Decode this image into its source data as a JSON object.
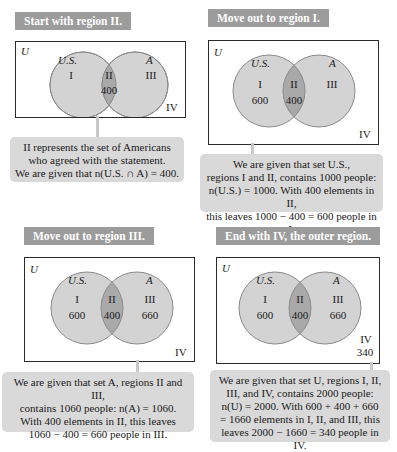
{
  "colors": {
    "title_bg": "#9c9c9c",
    "title_text": "#ffffff",
    "circle_fill": "#d3d3d3",
    "intersection_fill": "#a9a9a9",
    "circle_stroke": "#8a8a8a",
    "callout_bg": "#d9d9d9",
    "box_border": "#2a2a2a"
  },
  "panels": [
    {
      "title": "Start with region II.",
      "universe_label": "U",
      "set_left_label": "U.S.",
      "set_right_label": "A",
      "regions": {
        "I": {
          "name": "I",
          "value": ""
        },
        "II": {
          "name": "II",
          "value": "400"
        },
        "III": {
          "name": "III",
          "value": ""
        },
        "IV": {
          "name": "IV",
          "value": ""
        }
      },
      "callout_lines": [
        "II represents the set of Americans",
        "who agreed with the statement.",
        "We are given that n(U.S. ∩ A) = 400."
      ]
    },
    {
      "title": "Move out to region I.",
      "universe_label": "U",
      "set_left_label": "U.S.",
      "set_right_label": "A",
      "regions": {
        "I": {
          "name": "I",
          "value": "600"
        },
        "II": {
          "name": "II",
          "value": "400"
        },
        "III": {
          "name": "III",
          "value": ""
        },
        "IV": {
          "name": "IV",
          "value": ""
        }
      },
      "callout_lines": [
        "We are given that set U.S.,",
        "regions I and II, contains 1000 people:",
        "n(U.S.) = 1000. With 400 elements in II,",
        "this leaves 1000 − 400 = 600 people in I."
      ]
    },
    {
      "title": "Move out to region III.",
      "universe_label": "U",
      "set_left_label": "U.S.",
      "set_right_label": "A",
      "regions": {
        "I": {
          "name": "I",
          "value": "600"
        },
        "II": {
          "name": "II",
          "value": "400"
        },
        "III": {
          "name": "III",
          "value": "660"
        },
        "IV": {
          "name": "IV",
          "value": ""
        }
      },
      "callout_lines": [
        "We are given that set A, regions II and III,",
        "contains 1060 people: n(A) = 1060.",
        "With 400 elements in II, this leaves",
        "1060 − 400 = 660 people in III."
      ]
    },
    {
      "title": "End with IV, the outer region.",
      "universe_label": "U",
      "set_left_label": "U.S.",
      "set_right_label": "A",
      "regions": {
        "I": {
          "name": "I",
          "value": "600"
        },
        "II": {
          "name": "II",
          "value": "400"
        },
        "III": {
          "name": "III",
          "value": "660"
        },
        "IV": {
          "name": "IV",
          "value": "340"
        }
      },
      "callout_lines": [
        "We are given that set U, regions I, II,",
        "III, and IV, contains 2000 people:",
        "n(U) = 2000.  With 600 + 400 + 660",
        "= 1660 elements in I, II, and III, this",
        "leaves 2000 − 1660 = 340 people in IV."
      ]
    }
  ]
}
